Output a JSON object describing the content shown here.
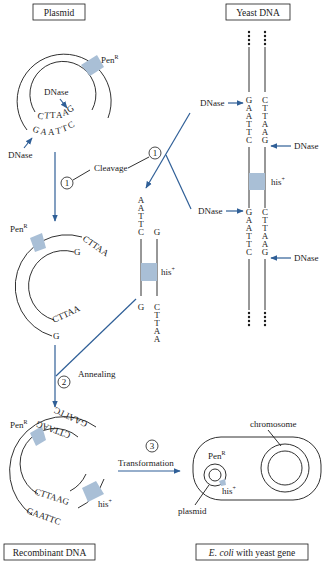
{
  "figure": {
    "title_boxes": {
      "plasmid": "Plasmid",
      "yeast_dna": "Yeast DNA",
      "recombinant_dna": "Recombinant DNA",
      "ecoli_prefix": "E. coli",
      "ecoli_suffix": " with yeast gene"
    },
    "colors": {
      "arrow_blue": "#2f5f97",
      "gene_shade": "#a9bfd6",
      "line_black": "#1a1a1a"
    },
    "plasmid": {
      "marker": "Pen",
      "marker_sup": "R",
      "enzyme_inner": "DNase",
      "enzyme_outer": "DNase",
      "inner_seq": [
        "C",
        "T",
        "T",
        "A",
        "A",
        "G"
      ],
      "outer_seq": [
        "G",
        "A",
        "A",
        "T",
        "T",
        "C"
      ]
    },
    "steps": [
      {
        "number": "1",
        "label": "Cleavage"
      },
      {
        "number": "2",
        "label": "Annealing"
      },
      {
        "number": "3",
        "label": "Transformation"
      }
    ],
    "cleaved_plasmid": {
      "marker": "Pen",
      "marker_sup": "R",
      "top_outer_seq": "CTTAA",
      "top_inner_seq": "G",
      "bottom_inner_seq": "CTTAA",
      "bottom_outer_seq": "G"
    },
    "fragment": {
      "left_top": [
        "A",
        "A",
        "T",
        "T",
        "C"
      ],
      "right_top": [
        "G"
      ],
      "left_bottom": [
        "G"
      ],
      "right_bottom": [
        "C",
        "T",
        "T",
        "A",
        "A"
      ],
      "gene": "his",
      "gene_sup": "+"
    },
    "yeast_dna": {
      "left_top": [
        "G",
        "A",
        "A",
        "T",
        "T",
        "C"
      ],
      "right_top": [
        "C",
        "T",
        "T",
        "A",
        "A",
        "G"
      ],
      "left_bottom": [
        "G",
        "A",
        "A",
        "T",
        "T",
        "C"
      ],
      "right_bottom": [
        "C",
        "T",
        "T",
        "A",
        "A",
        "G"
      ],
      "gene": "his",
      "gene_sup": "+",
      "enzyme_labels": [
        "DNase",
        "DNase",
        "DNase",
        "DNase"
      ]
    },
    "recombinant": {
      "marker": "Pen",
      "marker_sup": "R",
      "gene": "his",
      "gene_sup": "+",
      "inner_seq_bottom": "CTTAAG",
      "outer_seq_bottom": "GAATTC",
      "inner_seq_right": "CTTAAG",
      "outer_seq_right": "GAATTC"
    },
    "ecoli": {
      "chromosome_label": "chromosome",
      "plasmid_label": "plasmid",
      "marker": "Pen",
      "marker_sup": "R",
      "gene": "his",
      "gene_sup": "+"
    }
  }
}
